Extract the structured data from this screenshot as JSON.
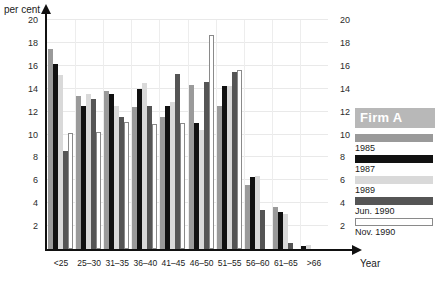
{
  "chart_data": {
    "type": "bar",
    "title": "",
    "ylabel": "per cent",
    "xlabel": "Year",
    "ylim": [
      0,
      20
    ],
    "ytick_step": 2,
    "yticks": [
      0,
      2,
      4,
      6,
      8,
      10,
      12,
      14,
      16,
      18,
      20
    ],
    "ytick_labels_left": [
      "2",
      "4",
      "6",
      "8",
      "10",
      "12",
      "14",
      "16",
      "18",
      "20"
    ],
    "ytick_labels_right": [
      "2",
      "4",
      "6",
      "8",
      "10",
      "12",
      "14",
      "16",
      "18",
      "20"
    ],
    "grid": true,
    "legend_position": "right",
    "legend_title": "Firm A",
    "categories": [
      "<25",
      "25–30",
      "31–35",
      "36–40",
      "41–45",
      "46–50",
      "51–55",
      "56–60",
      "61–65",
      ">66"
    ],
    "series": [
      {
        "name": "1985",
        "color": "#9a9a9a",
        "values": [
          17.5,
          13.4,
          13.8,
          12.4,
          11.5,
          14.3,
          12.5,
          5.6,
          3.65,
          0.0
        ]
      },
      {
        "name": "1987",
        "color": "#111111",
        "values": [
          16.2,
          12.5,
          13.5,
          14.0,
          12.5,
          11.0,
          14.2,
          6.3,
          3.2,
          0.3
        ]
      },
      {
        "name": "1989",
        "color": "#d9d9d9",
        "values": [
          15.2,
          13.5,
          12.5,
          14.5,
          12.8,
          10.4,
          14.2,
          6.35,
          3.1,
          0.35
        ]
      },
      {
        "name": "Jun. 1990",
        "color": "#555555",
        "values": [
          8.6,
          13.1,
          11.5,
          12.5,
          15.3,
          14.6,
          15.5,
          3.45,
          0.5,
          0.0
        ]
      },
      {
        "name": "Nov. 1990",
        "color": "#ffffff",
        "values": [
          10.1,
          10.2,
          11.1,
          10.9,
          11.0,
          18.7,
          15.6,
          0.0,
          0.0,
          0.0
        ]
      }
    ]
  },
  "legend": {
    "title": "Firm A",
    "items": [
      {
        "label": "1985"
      },
      {
        "label": "1987"
      },
      {
        "label": "1989"
      },
      {
        "label": "Jun. 1990"
      },
      {
        "label": "Nov. 1990"
      }
    ]
  }
}
